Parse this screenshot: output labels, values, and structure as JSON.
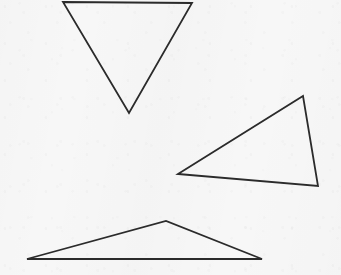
{
  "canvas": {
    "width": 341,
    "height": 275,
    "background_color": "#f7f7f7",
    "description": "Scanned line drawing of three outlined triangles on plain off-white paper"
  },
  "style": {
    "stroke_color": "#2b2b2b",
    "stroke_width": 1.8,
    "fill": "none"
  },
  "chart_data": {
    "type": "scatter",
    "title": "",
    "subtitle": "",
    "xlabel": "",
    "ylabel": "",
    "grid": false,
    "legend": "none",
    "xlim": [
      0,
      341
    ],
    "ylim": [
      0,
      275
    ],
    "shape_count": 3,
    "shapes": [
      {
        "name": "inverted-triangle",
        "kind": "triangle",
        "orientation": "point-down",
        "points": "63,2 192,3 129,113",
        "vertices": [
          [
            63,
            2
          ],
          [
            192,
            3
          ],
          [
            129,
            113
          ]
        ],
        "stroke": "#2b2b2b",
        "stroke_width": 1.8,
        "fill": "none"
      },
      {
        "name": "tilted-right-triangle",
        "kind": "triangle",
        "orientation": "apex-upper-right",
        "points": "178,174 303,96 318,186",
        "vertices": [
          [
            178,
            174
          ],
          [
            303,
            96
          ],
          [
            318,
            186
          ]
        ],
        "stroke": "#2b2b2b",
        "stroke_width": 1.8,
        "fill": "none"
      },
      {
        "name": "flat-obtuse-triangle",
        "kind": "triangle",
        "orientation": "point-up-wide-base",
        "points": "27,259 166,221 262,259",
        "vertices": [
          [
            27,
            259
          ],
          [
            166,
            221
          ],
          [
            262,
            259
          ]
        ],
        "stroke": "#2b2b2b",
        "stroke_width": 1.8,
        "fill": "none"
      }
    ]
  }
}
